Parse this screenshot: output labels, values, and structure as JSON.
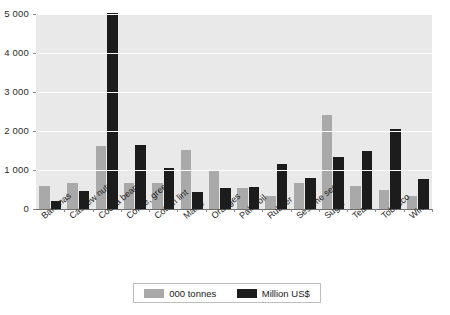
{
  "chart_data": {
    "type": "bar",
    "title": "",
    "subtitle": "",
    "xlabel": "",
    "ylabel": "",
    "ylim": [
      0,
      5000
    ],
    "yticks": [
      0,
      1000,
      2000,
      3000,
      4000,
      5000
    ],
    "ytick_labels": [
      "0",
      "1 000",
      "2 000",
      "3 000",
      "4 000",
      "5 000"
    ],
    "grid": true,
    "legend_position": "bottom",
    "categories": [
      "Bananas",
      "Cashew nuts",
      "Cocoa beans",
      "Coffee, green",
      "Cotton lint",
      "Maize",
      "Oranges",
      "Palm oil",
      "Rubber",
      "Sesame seed",
      "Sugar",
      "Tea",
      "Tobacco",
      "Wine"
    ],
    "series": [
      {
        "name": "000 tonnes",
        "color": "#a9a9a9",
        "values": [
          590,
          660,
          1620,
          665,
          665,
          1520,
          990,
          530,
          345,
          670,
          2420,
          585,
          480,
          345
        ]
      },
      {
        "name": "Million US$",
        "color": "#1c1c1c",
        "values": [
          215,
          450,
          5030,
          1650,
          1040,
          425,
          545,
          560,
          1145,
          800,
          1330,
          1490,
          2050,
          775
        ]
      }
    ]
  },
  "legend": {
    "items": [
      {
        "label": "000 tonnes",
        "swatch": "series-a"
      },
      {
        "label": "Million US$",
        "swatch": "series-b"
      }
    ]
  }
}
